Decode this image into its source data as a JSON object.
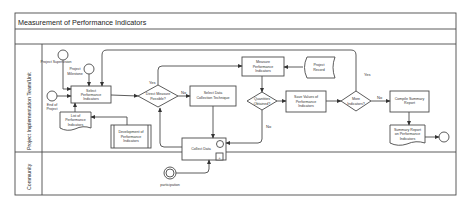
{
  "diagram": {
    "title": "Measurement of Performance Indicators",
    "lanes": [
      {
        "label": "Project Implementation Team/Unit"
      },
      {
        "label": "Community"
      }
    ],
    "events": {
      "project_supervision": "Project Supervision",
      "project_milestone": "Project Milestone",
      "end_of_project": "End of Project",
      "participation": "participation"
    },
    "tasks": {
      "select_pi": [
        "Select",
        "Performance",
        "Indicators"
      ],
      "select_dct": [
        "Select Data",
        "Collection Technique"
      ],
      "measure_pi": [
        "Measure",
        "Performance",
        "Indicators"
      ],
      "save_values": [
        "Save Values of",
        "Performance",
        "Indicators"
      ],
      "compile_report": [
        "Compile Summary",
        "Report"
      ],
      "collect_data": "Collect Data",
      "development_pi": [
        "Development of",
        "Performance",
        "Indicators"
      ]
    },
    "gateways": {
      "direct_measure": [
        "Direct Measure",
        "Possible?"
      ],
      "quantities": [
        "Quantities",
        "Obtained?"
      ],
      "more_indicators": [
        "More",
        "Indicators?"
      ]
    },
    "data": {
      "project_record": [
        "Project",
        "Record"
      ],
      "list_pi": [
        "List of",
        "Performance",
        "Indicators"
      ],
      "summary_report": [
        "Summary Report",
        "on Performance",
        "Indicators"
      ]
    },
    "flow_labels": {
      "yes_direct": "Yes",
      "no_direct": "No",
      "no_quantities": "No",
      "yes_more": "Yes",
      "no_more": "No"
    }
  }
}
